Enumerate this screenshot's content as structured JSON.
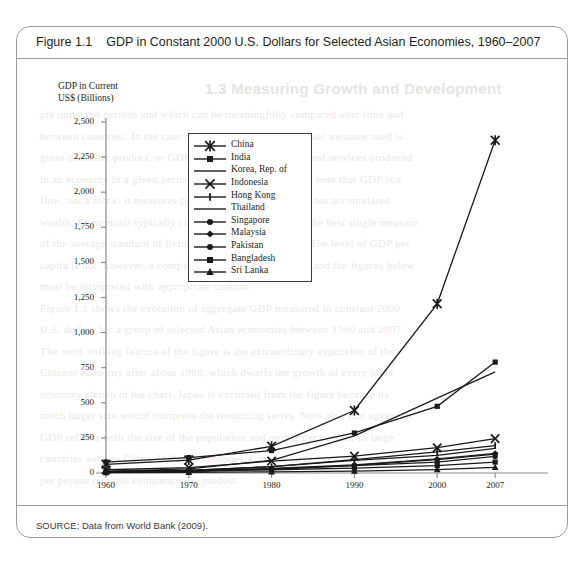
{
  "figure": {
    "label": "Figure 1.1",
    "caption": "GDP in Constant 2000 U.S. Dollars for Selected Asian Economies, 1960–2007",
    "source": "SOURCE: Data from World Bank (2009)."
  },
  "background_text": {
    "heading": "1.3   Measuring Growth and Development",
    "lines": [
      "ple units and periods and which can be meaningfully compared over time and",
      "between countries. In the case of economic growth, the basic measure used is",
      "gross domestic product, or GDP, the total value of goods and services produced",
      "in an economy in a given period of time. It is important to note that GDP is a",
      "flow, not a stock: it measures production per unit of time, not accumulated",
      "wealth. Economists typically consider GDP per capita as the best single measure",
      "of the average standard of living of a country's residents. The level of GDP per",
      "capita is not, however, a complete measure of well-being, and the figures below",
      "must be interpreted with appropriate caution.",
      "Figure 1.1 shows the evolution of aggregate GDP measured in constant 2000",
      "U.S. dollars for a group of selected Asian economies between 1960 and 2007.",
      "The most striking feature of the figure is the extraordinary expansion of the",
      "Chinese economy after about 1980, which dwarfs the growth of every other",
      "economy shown in the chart. Japan is excluded from the figure because its",
      "much larger size would compress the remaining series. Note also that aggregate",
      "GDP reflects both the size of the population and output per person, so large",
      "countries such as China, India, and Indonesia appear large even when income",
      "per person remains comparatively modest."
    ]
  },
  "chart_data": {
    "type": "line",
    "title": "GDP in Constant 2000 U.S. Dollars for Selected Asian Economies, 1960–2007",
    "ylabel": "GDP in Current US$ (Billions)",
    "xlabel": "",
    "x": [
      1960,
      1970,
      1980,
      1990,
      2000,
      2007
    ],
    "xtick_labels": [
      "1960",
      "1970",
      "1980",
      "1990",
      "2000",
      "2007"
    ],
    "ytick_labels": [
      "0",
      "250",
      "500",
      "750",
      "1,000",
      "1,250",
      "1,500",
      "1,750",
      "2,000",
      "2,250",
      "2,500"
    ],
    "ytick_values": [
      0,
      250,
      500,
      750,
      1000,
      1250,
      1500,
      1750,
      2000,
      2250,
      2500
    ],
    "ylim": [
      0,
      2500
    ],
    "grid": false,
    "legend_position": "upper-center-left",
    "series": [
      {
        "name": "China",
        "marker": "asterisk",
        "values": [
          62,
          92,
          190,
          445,
          1205,
          2370
        ]
      },
      {
        "name": "India",
        "marker": "square",
        "values": [
          78,
          110,
          160,
          285,
          475,
          790
        ]
      },
      {
        "name": "Korea, Rep. of",
        "marker": "line",
        "values": [
          12,
          30,
          90,
          265,
          533,
          720
        ]
      },
      {
        "name": "Indonesia",
        "marker": "x",
        "values": [
          23,
          38,
          85,
          120,
          180,
          245
        ]
      },
      {
        "name": "Hong Kong",
        "marker": "plus",
        "values": [
          8,
          18,
          45,
          95,
          150,
          195
        ]
      },
      {
        "name": "Thailand",
        "marker": "line",
        "values": [
          9,
          19,
          45,
          90,
          125,
          175
        ]
      },
      {
        "name": "Singapore",
        "marker": "circle",
        "values": [
          4,
          10,
          25,
          55,
          95,
          135
        ]
      },
      {
        "name": "Malaysia",
        "marker": "diamond",
        "values": [
          7,
          14,
          32,
          58,
          100,
          140
        ]
      },
      {
        "name": "Pakistan",
        "marker": "circle",
        "values": [
          10,
          18,
          30,
          52,
          78,
          118
        ]
      },
      {
        "name": "Bangladesh",
        "marker": "square",
        "values": [
          12,
          17,
          23,
          35,
          53,
          78
        ]
      },
      {
        "name": "Sri Lanka",
        "marker": "triangle",
        "values": [
          3,
          5,
          8,
          14,
          24,
          40
        ]
      }
    ]
  },
  "legend": {
    "items": [
      {
        "label": "China",
        "marker": "asterisk"
      },
      {
        "label": "India",
        "marker": "square"
      },
      {
        "label": "Korea, Rep. of",
        "marker": "line"
      },
      {
        "label": "Indonesia",
        "marker": "x"
      },
      {
        "label": "Hong Kong",
        "marker": "plus"
      },
      {
        "label": "Thailand",
        "marker": "line"
      },
      {
        "label": "Singapore",
        "marker": "circle"
      },
      {
        "label": "Malaysia",
        "marker": "diamond"
      },
      {
        "label": "Pakistan",
        "marker": "circle"
      },
      {
        "label": "Bangladesh",
        "marker": "square"
      },
      {
        "label": "Sri Lanka",
        "marker": "triangle"
      }
    ]
  }
}
